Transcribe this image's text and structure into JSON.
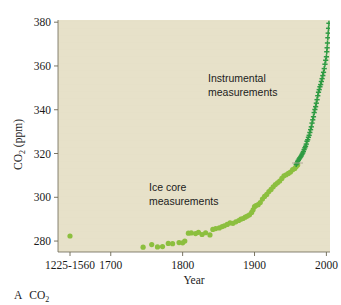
{
  "figure": {
    "caption_letter": "A",
    "caption_text": "CO",
    "caption_sub": "2",
    "background_color": "#ffffff",
    "plot_background_color": "#e7e1c9"
  },
  "chart_data": {
    "type": "scatter",
    "title": "",
    "xlabel": "Year",
    "ylabel_main": "CO",
    "ylabel_sub": "2",
    "ylabel_unit": " (ppm)",
    "ylabel_full": "CO2 (ppm)",
    "ylim": [
      275,
      381
    ],
    "yticks": [
      280,
      300,
      320,
      340,
      360,
      380
    ],
    "ytick_labels": [
      "280",
      "300",
      "320",
      "340",
      "360",
      "380"
    ],
    "xlim": [
      1660,
      2005
    ],
    "xticks": [
      1700,
      1800,
      1900,
      2000
    ],
    "xtick_labels": [
      "1700",
      "1800",
      "1900",
      "2000"
    ],
    "x_category_label": "1225-1560",
    "x_category_value": 1225,
    "grid": false,
    "legend": "none",
    "annotations": [
      {
        "name": "instrumental-measurements",
        "line1": "Instrumental",
        "line2": "measurements",
        "x": 1905,
        "y": 347
      },
      {
        "name": "ice-core-measurements",
        "line1": "Ice core",
        "line2": "measurements",
        "x": 1813,
        "y": 301
      }
    ],
    "series": [
      {
        "name": "Ice core measurements",
        "marker": "circle",
        "color": "#8cbf3f",
        "points": [
          [
            1225,
            282.3
          ],
          [
            1745,
            277.2
          ],
          [
            1757,
            278.4
          ],
          [
            1765,
            277.3
          ],
          [
            1772,
            277.5
          ],
          [
            1780,
            278.9
          ],
          [
            1786,
            278.8
          ],
          [
            1795,
            279.3
          ],
          [
            1800,
            279.2
          ],
          [
            1803,
            280.0
          ],
          [
            1808,
            283.6
          ],
          [
            1812,
            283.7
          ],
          [
            1818,
            283.4
          ],
          [
            1822,
            284.0
          ],
          [
            1827,
            283.0
          ],
          [
            1832,
            283.8
          ],
          [
            1838,
            282.8
          ],
          [
            1842,
            285.3
          ],
          [
            1846,
            285.7
          ],
          [
            1851,
            286.0
          ],
          [
            1855,
            286.6
          ],
          [
            1858,
            287.0
          ],
          [
            1862,
            287.6
          ],
          [
            1866,
            288.3
          ],
          [
            1870,
            288.1
          ],
          [
            1874,
            288.8
          ],
          [
            1878,
            289.4
          ],
          [
            1881,
            290.0
          ],
          [
            1884,
            290.3
          ],
          [
            1887,
            290.9
          ],
          [
            1890,
            291.4
          ],
          [
            1893,
            292.0
          ],
          [
            1896,
            293.1
          ],
          [
            1898,
            294.3
          ],
          [
            1900,
            295.7
          ],
          [
            1902,
            296.2
          ],
          [
            1905,
            296.6
          ],
          [
            1908,
            297.6
          ],
          [
            1911,
            299.2
          ],
          [
            1914,
            300.4
          ],
          [
            1917,
            301.3
          ],
          [
            1920,
            302.6
          ],
          [
            1923,
            303.6
          ],
          [
            1926,
            304.8
          ],
          [
            1929,
            305.8
          ],
          [
            1932,
            306.6
          ],
          [
            1935,
            307.4
          ],
          [
            1938,
            308.6
          ],
          [
            1941,
            309.8
          ],
          [
            1944,
            310.3
          ],
          [
            1947,
            310.9
          ],
          [
            1950,
            311.5
          ],
          [
            1953,
            312.6
          ],
          [
            1956,
            313.2
          ],
          [
            1958,
            314.1
          ],
          [
            1960,
            314.8
          ]
        ]
      },
      {
        "name": "Instrumental measurements",
        "marker": "plus",
        "color": "#2f9b43",
        "points": [
          [
            1958,
            315.0
          ],
          [
            1959,
            315.6
          ],
          [
            1960,
            316.4
          ],
          [
            1961,
            316.9
          ],
          [
            1962,
            317.5
          ],
          [
            1963,
            318.0
          ],
          [
            1964,
            318.4
          ],
          [
            1965,
            318.9
          ],
          [
            1966,
            319.6
          ],
          [
            1967,
            320.2
          ],
          [
            1968,
            320.9
          ],
          [
            1969,
            321.8
          ],
          [
            1970,
            322.6
          ],
          [
            1971,
            323.3
          ],
          [
            1972,
            324.3
          ],
          [
            1973,
            325.6
          ],
          [
            1974,
            326.3
          ],
          [
            1975,
            327.4
          ],
          [
            1976,
            328.3
          ],
          [
            1977,
            329.6
          ],
          [
            1978,
            330.9
          ],
          [
            1979,
            332.2
          ],
          [
            1980,
            333.9
          ],
          [
            1981,
            335.4
          ],
          [
            1982,
            336.8
          ],
          [
            1983,
            338.7
          ],
          [
            1984,
            340.1
          ],
          [
            1985,
            341.4
          ],
          [
            1986,
            343.0
          ],
          [
            1987,
            344.6
          ],
          [
            1988,
            346.4
          ],
          [
            1989,
            348.0
          ],
          [
            1990,
            349.2
          ],
          [
            1991,
            350.5
          ],
          [
            1992,
            351.5
          ],
          [
            1993,
            352.9
          ],
          [
            1994,
            354.2
          ],
          [
            1995,
            355.6
          ],
          [
            1996,
            357.1
          ],
          [
            1997,
            358.8
          ],
          [
            1998,
            360.8
          ],
          [
            1999,
            362.6
          ],
          [
            2000,
            364.2
          ],
          [
            2000.5,
            366.5
          ],
          [
            2001,
            368.3
          ],
          [
            2001.5,
            370.5
          ],
          [
            2002,
            372.9
          ],
          [
            2002.5,
            375.0
          ],
          [
            2003,
            377.2
          ],
          [
            2003.5,
            379.5
          ]
        ]
      }
    ]
  }
}
